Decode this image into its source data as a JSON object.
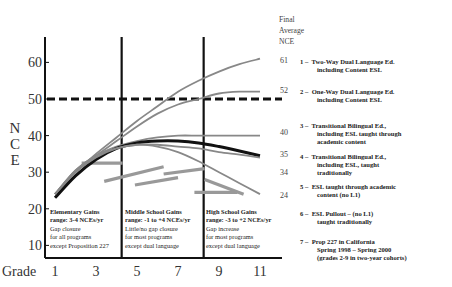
{
  "chart_data": {
    "type": "line",
    "title": "",
    "ylabel": "NCE",
    "xlabel": "Grade",
    "ylim": [
      8,
      68
    ],
    "xlim": [
      0.5,
      12
    ],
    "yticks": [
      10,
      20,
      30,
      40,
      50,
      60
    ],
    "xticks": [
      1,
      3,
      5,
      7,
      9,
      11
    ],
    "reference_line": {
      "value": 50,
      "style": "dashed"
    },
    "dividers": [
      4.3,
      8.3
    ],
    "final_header": [
      "Final",
      "Average",
      "NCE"
    ],
    "series": [
      {
        "name": "1 – Two-Way Dual Language Ed. including Content ESL",
        "final": "61",
        "color": "#888888",
        "points": [
          [
            1,
            24
          ],
          [
            2,
            30
          ],
          [
            3,
            35
          ],
          [
            4,
            39.5
          ],
          [
            5,
            44
          ],
          [
            6,
            48
          ],
          [
            7,
            52
          ],
          [
            8,
            55
          ],
          [
            9,
            57.5
          ],
          [
            10,
            59.5
          ],
          [
            11,
            61
          ]
        ]
      },
      {
        "name": "2 – One-Way Dual Language Ed. including Content ESL",
        "final": "52",
        "color": "#888888",
        "points": [
          [
            1,
            24
          ],
          [
            2,
            30
          ],
          [
            3,
            34.5
          ],
          [
            4,
            38.5
          ],
          [
            5,
            42.5
          ],
          [
            6,
            46
          ],
          [
            7,
            48.5
          ],
          [
            8,
            50
          ],
          [
            9,
            51.5
          ],
          [
            10,
            52
          ],
          [
            11,
            52
          ]
        ]
      },
      {
        "name": "3 – Transitional Bilingual Ed., including ESL taught through academic content",
        "final": "40",
        "color": "#888888",
        "points": [
          [
            1,
            24
          ],
          [
            2,
            30.5
          ],
          [
            3,
            34.5
          ],
          [
            4,
            37
          ],
          [
            5,
            38.5
          ],
          [
            6,
            39.5
          ],
          [
            7,
            40
          ],
          [
            8,
            40
          ],
          [
            9,
            40
          ],
          [
            10,
            40
          ],
          [
            11,
            40
          ]
        ]
      },
      {
        "name": "4 – Transitional Bilingual Ed., including ESL, taught traditionally",
        "final": "35",
        "color": "#111111",
        "bold": true,
        "points": [
          [
            1,
            23
          ],
          [
            2,
            29
          ],
          [
            3,
            33.5
          ],
          [
            4,
            36.5
          ],
          [
            5,
            38
          ],
          [
            6,
            38.5
          ],
          [
            7,
            38.5
          ],
          [
            8,
            38
          ],
          [
            9,
            37
          ],
          [
            10,
            35.8
          ],
          [
            11,
            34.5
          ]
        ]
      },
      {
        "name": "5 – ESL taught through academic content (no L1)",
        "final": "34",
        "color": "#888888",
        "points": [
          [
            1,
            24
          ],
          [
            2,
            30.5
          ],
          [
            3,
            34.5
          ],
          [
            4,
            36.5
          ],
          [
            5,
            37.5
          ],
          [
            6,
            37.5
          ],
          [
            7,
            37
          ],
          [
            8,
            36.5
          ],
          [
            9,
            35.5
          ],
          [
            10,
            34.8
          ],
          [
            11,
            34
          ]
        ]
      },
      {
        "name": "6 – ESL Pullout – (no L1) taught traditionally",
        "final": "24",
        "color": "#888888",
        "points": [
          [
            1,
            24
          ],
          [
            2,
            30
          ],
          [
            3,
            34
          ],
          [
            4,
            36.5
          ],
          [
            5,
            37.5
          ],
          [
            6,
            37
          ],
          [
            7,
            35.5
          ],
          [
            8,
            33
          ],
          [
            9,
            30
          ],
          [
            10,
            27
          ],
          [
            11,
            24
          ]
        ]
      }
    ],
    "segments_prop227": {
      "name": "7 – Prop 227 in California Spring 1998 – Spring 2000 (grades 2-9 in two-year cohorts)",
      "color": "#999999",
      "lines": [
        [
          [
            2.3,
            32.5
          ],
          [
            4.3,
            32.5
          ]
        ],
        [
          [
            3.4,
            27.5
          ],
          [
            6.3,
            31.5
          ]
        ],
        [
          [
            4.9,
            26.5
          ],
          [
            7.0,
            28.5
          ]
        ],
        [
          [
            6.3,
            29.5
          ],
          [
            8.3,
            31
          ]
        ],
        [
          [
            7.8,
            24.5
          ],
          [
            9.9,
            24.5
          ]
        ],
        [
          [
            8.3,
            28
          ],
          [
            10.2,
            24
          ]
        ]
      ]
    },
    "annotations": [
      {
        "title": "Elementary Gains",
        "subtitle": "range: 3-4 NCEs/yr",
        "lines": [
          "Gap closure",
          "for all programs",
          "except Proposition 227"
        ]
      },
      {
        "title": "Middle School Gains",
        "subtitle": "range: -1 to +4 NCEs/yr",
        "lines": [
          "Little/no gap closure",
          "for most programs",
          "except dual language"
        ]
      },
      {
        "title": "High School Gains",
        "subtitle": "range: -3 to +2 NCEs/yr",
        "lines": [
          "Gap increase",
          "for most programs",
          "except dual language"
        ]
      }
    ]
  },
  "legend": [
    {
      "num": "1 –",
      "l1": "Two-Way Dual Language Ed.",
      "l2": "including Content ESL",
      "l3": ""
    },
    {
      "num": "2 –",
      "l1": "One-Way Dual Language Ed.",
      "l2": "including Content ESL",
      "l3": ""
    },
    {
      "num": "3 –",
      "l1": "Transitional Bilingual Ed.,",
      "l2": "including   ESL taught through",
      "l3": "academic content"
    },
    {
      "num": "4 –",
      "l1": "Transitional Bilingual Ed.,",
      "l2": "including ESL, taught",
      "l3": "traditionally"
    },
    {
      "num": "5 –",
      "l1": "ESL taught through academic",
      "l2": "content (no L1)",
      "l3": ""
    },
    {
      "num": "6 –",
      "l1": "ESL Pullout – (no L1)",
      "l2": "taught traditionally",
      "l3": ""
    },
    {
      "num": "7 –",
      "l1": "Prop 227 in California",
      "l2": "Spring 1998 – Spring 2000",
      "l3": "(grades 2-9 in two-year cohorts)"
    }
  ],
  "axis_labels": {
    "y": [
      "N",
      "C",
      "E"
    ],
    "x": "Grade"
  }
}
